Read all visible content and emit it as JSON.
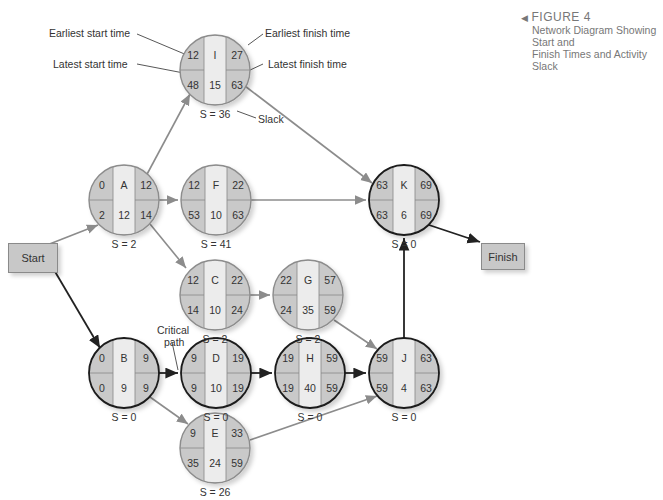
{
  "caption": {
    "title": "FIGURE 4",
    "subtitle_line1": "Network Diagram Showing Start and",
    "subtitle_line2": "Finish Times and Activity Slack"
  },
  "legend_labels": {
    "earliest_start": "Earliest start time",
    "earliest_finish": "Earliest finish time",
    "latest_start": "Latest start time",
    "latest_finish": "Latest finish time",
    "slack": "Slack",
    "critical_path": "Critical\npath",
    "critical_line1": "Critical",
    "critical_line2": "path"
  },
  "terminals": {
    "start": "Start",
    "finish": "Finish"
  },
  "colors": {
    "shaded": "#c9c9c9",
    "center": "#ececec",
    "critical_edge": "#222222",
    "normal_edge": "#8c8c8c"
  },
  "nodes": {
    "I": {
      "name": "I",
      "es": "12",
      "ef": "27",
      "ls": "48",
      "lf": "63",
      "dur": "15",
      "slack": "S = 36",
      "critical": false
    },
    "A": {
      "name": "A",
      "es": "0",
      "ef": "12",
      "ls": "2",
      "lf": "14",
      "dur": "12",
      "slack": "S = 2",
      "critical": false
    },
    "F": {
      "name": "F",
      "es": "12",
      "ef": "22",
      "ls": "53",
      "lf": "63",
      "dur": "10",
      "slack": "S = 41",
      "critical": false
    },
    "K": {
      "name": "K",
      "es": "63",
      "ef": "69",
      "ls": "63",
      "lf": "69",
      "dur": "6",
      "slack": "S = 0",
      "critical": true
    },
    "C": {
      "name": "C",
      "es": "12",
      "ef": "22",
      "ls": "14",
      "lf": "24",
      "dur": "10",
      "slack": "S = 2",
      "critical": false
    },
    "G": {
      "name": "G",
      "es": "22",
      "ef": "57",
      "ls": "24",
      "lf": "59",
      "dur": "35",
      "slack": "S = 2",
      "critical": false
    },
    "B": {
      "name": "B",
      "es": "0",
      "ef": "9",
      "ls": "0",
      "lf": "9",
      "dur": "9",
      "slack": "S = 0",
      "critical": true
    },
    "D": {
      "name": "D",
      "es": "9",
      "ef": "19",
      "ls": "9",
      "lf": "19",
      "dur": "10",
      "slack": "S = 0",
      "critical": true
    },
    "H": {
      "name": "H",
      "es": "19",
      "ef": "59",
      "ls": "19",
      "lf": "59",
      "dur": "40",
      "slack": "S = 0",
      "critical": true
    },
    "J": {
      "name": "J",
      "es": "59",
      "ef": "63",
      "ls": "59",
      "lf": "63",
      "dur": "4",
      "slack": "S = 0",
      "critical": true
    },
    "E": {
      "name": "E",
      "es": "9",
      "ef": "33",
      "ls": "35",
      "lf": "59",
      "dur": "24",
      "slack": "S = 26",
      "critical": false
    }
  },
  "edges": [
    {
      "from": "Start",
      "to": "A",
      "critical": false
    },
    {
      "from": "Start",
      "to": "B",
      "critical": true
    },
    {
      "from": "A",
      "to": "I",
      "critical": false
    },
    {
      "from": "A",
      "to": "F",
      "critical": false
    },
    {
      "from": "A",
      "to": "C",
      "critical": false
    },
    {
      "from": "I",
      "to": "K",
      "critical": false
    },
    {
      "from": "F",
      "to": "K",
      "critical": false
    },
    {
      "from": "C",
      "to": "G",
      "critical": false
    },
    {
      "from": "G",
      "to": "J",
      "critical": false
    },
    {
      "from": "B",
      "to": "D",
      "critical": true
    },
    {
      "from": "B",
      "to": "E",
      "critical": false
    },
    {
      "from": "D",
      "to": "H",
      "critical": true
    },
    {
      "from": "H",
      "to": "J",
      "critical": true
    },
    {
      "from": "E",
      "to": "J",
      "critical": false
    },
    {
      "from": "J",
      "to": "K",
      "critical": true
    },
    {
      "from": "K",
      "to": "Finish",
      "critical": true
    }
  ]
}
